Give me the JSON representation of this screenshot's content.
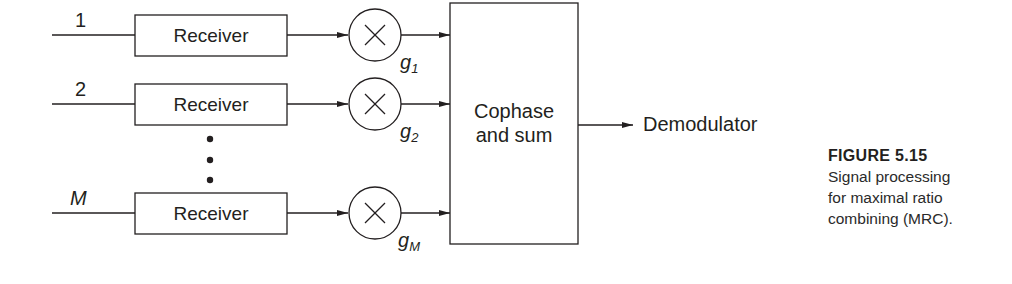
{
  "figure": {
    "number_label": "FIGURE 5.15",
    "caption_lines": [
      "Signal processing",
      "for maximal ratio",
      "combining (MRC)."
    ]
  },
  "branches": [
    {
      "input_label": "1",
      "block_label": "Receiver",
      "gain_symbol": "g",
      "gain_subscript": "1"
    },
    {
      "input_label": "2",
      "block_label": "Receiver",
      "gain_symbol": "g",
      "gain_subscript": "2"
    },
    {
      "input_label": "M",
      "block_label": "Receiver",
      "gain_symbol": "g",
      "gain_subscript": "M"
    }
  ],
  "ellipsis": "⋮",
  "multiplier_icon": "multiply-circle-icon",
  "combiner": {
    "line1": "Cophase",
    "line2": "and sum"
  },
  "output_label": "Demodulator"
}
